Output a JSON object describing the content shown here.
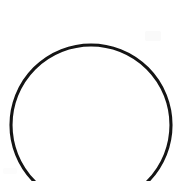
{
  "canvas": {
    "width": 181,
    "height": 181,
    "background_color": "#ffffff",
    "description": "circle-outline-drawing"
  },
  "figure": {
    "kind": "circle-outline",
    "stroke_color": "#141414",
    "fill": "none",
    "stroke_width": 3.1,
    "center_x": 91,
    "center_y": 125,
    "radius": 80,
    "clipped_edge": "bottom",
    "top_y": 45,
    "left_x": 11,
    "right_x": 171,
    "bottom_left_exit_x": 40,
    "bottom_right_exit_x": 151
  },
  "artifacts": {
    "smudge_top_right": "faint-gray-smudge",
    "smudge_bottom_left": "faint-gray-smudge"
  },
  "text": {
    "visible_text": ""
  }
}
